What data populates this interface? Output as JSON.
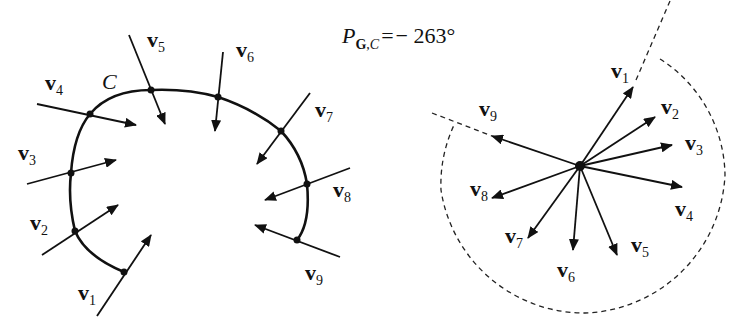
{
  "formula": {
    "symbol": "P",
    "subscript_bold": "G",
    "subscript_sep": ",",
    "subscript_italic": "C",
    "equals": "=",
    "value": "− 263°"
  },
  "curve": {
    "label": "C",
    "vectors": [
      {
        "name": "v",
        "index": "1"
      },
      {
        "name": "v",
        "index": "2"
      },
      {
        "name": "v",
        "index": "3"
      },
      {
        "name": "v",
        "index": "4"
      },
      {
        "name": "v",
        "index": "5"
      },
      {
        "name": "v",
        "index": "6"
      },
      {
        "name": "v",
        "index": "7"
      },
      {
        "name": "v",
        "index": "8"
      },
      {
        "name": "v",
        "index": "9"
      }
    ]
  },
  "polar": {
    "vectors": [
      {
        "name": "v",
        "index": "1"
      },
      {
        "name": "v",
        "index": "2"
      },
      {
        "name": "v",
        "index": "3"
      },
      {
        "name": "v",
        "index": "4"
      },
      {
        "name": "v",
        "index": "5"
      },
      {
        "name": "v",
        "index": "6"
      },
      {
        "name": "v",
        "index": "7"
      },
      {
        "name": "v",
        "index": "8"
      },
      {
        "name": "v",
        "index": "9"
      }
    ]
  }
}
